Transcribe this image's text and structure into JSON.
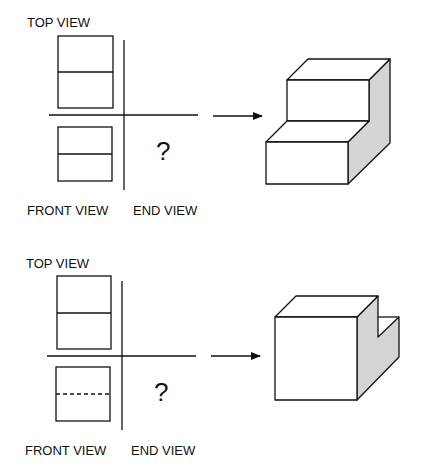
{
  "problems": [
    {
      "labels": {
        "top_view": "TOP VIEW",
        "front_view": "FRONT VIEW",
        "end_view": "END VIEW",
        "unknown": "?"
      },
      "front_view_middle_line": "solid",
      "object": "stepped block (two steps), right side shaded"
    },
    {
      "labels": {
        "top_view": "TOP VIEW",
        "front_view": "FRONT VIEW",
        "end_view": "END VIEW",
        "unknown": "?"
      },
      "front_view_middle_line": "dashed",
      "object": "block with notch cut at back right, right side shaded"
    }
  ],
  "colors": {
    "line": "#111111",
    "shade": "#d4d4d4",
    "background": "#ffffff"
  },
  "icons": {
    "arrow": "arrow-right-icon"
  }
}
